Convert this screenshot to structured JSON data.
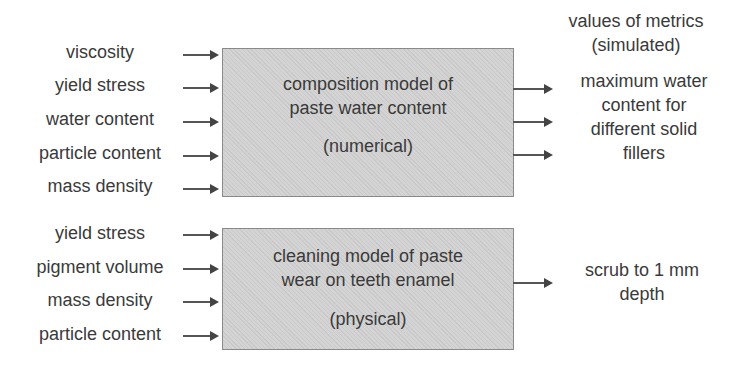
{
  "model1": {
    "inputs": [
      "viscosity",
      "yield stress",
      "water content",
      "particle content",
      "mass density"
    ],
    "title_line1": "composition model of",
    "title_line2": "paste water content",
    "type": "(numerical)",
    "outputs_header_line1": "values of metrics",
    "outputs_header_line2": "(simulated)",
    "output_line1": "maximum water",
    "output_line2": "content for",
    "output_line3": "different solid",
    "output_line4": "fillers"
  },
  "model2": {
    "inputs": [
      "yield stress",
      "pigment volume",
      "mass density",
      "particle content"
    ],
    "title_line1": "cleaning model of paste",
    "title_line2": "wear on teeth enamel",
    "type": "(physical)",
    "output_line1": "scrub to 1 mm",
    "output_line2": "depth"
  }
}
